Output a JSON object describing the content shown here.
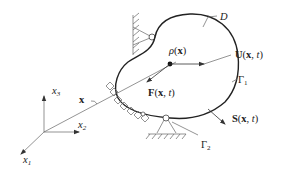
{
  "diagram": {
    "type": "continuum-body-schematic",
    "labels": {
      "domain": "D",
      "density": "ρ(x)",
      "density_parts": {
        "rho": "ρ",
        "open": "(",
        "x": "x",
        "close": ")"
      },
      "displacement": {
        "sym": "U",
        "args": "(x, t)",
        "x": "x",
        "t": "t"
      },
      "body_force": {
        "sym": "F",
        "args": "(x, t)",
        "x": "x",
        "t": "t"
      },
      "traction": {
        "sym": "S",
        "args": "(x, t)",
        "x": "x",
        "t": "t"
      },
      "boundary_1": {
        "sym": "Γ",
        "sub": "1"
      },
      "boundary_2": {
        "sym": "Γ",
        "sub": "2"
      },
      "position_vector": "x",
      "axes": [
        {
          "sym": "x",
          "sub": "1"
        },
        {
          "sym": "x",
          "sub": "2"
        },
        {
          "sym": "x",
          "sub": "3"
        }
      ]
    },
    "colors": {
      "outline": "#222222",
      "thin_lines": "#666666",
      "background": "#ffffff"
    }
  }
}
